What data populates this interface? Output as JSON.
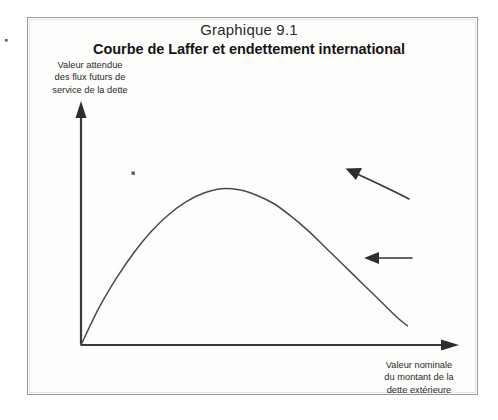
{
  "figure": {
    "label": "Graphique 9.1",
    "title": "Courbe de Laffer et endettement international",
    "y_axis_caption": "Valeur attendue des flux futurs de service de la dette",
    "y_axis_caption_lines": [
      "Valeur attendue",
      "des flux futurs de",
      "service de la dette"
    ],
    "x_axis_caption": "Valeur nominale du montant de la dette extérieure",
    "x_axis_caption_lines": [
      "Valeur nominale",
      "du montant de la",
      "dette extérieure"
    ]
  },
  "colors": {
    "ink": "#2d2d2d",
    "curve": "#4a4a4a",
    "axis": "#3a3a3a",
    "frame": "#9a9a9a",
    "paper": "#fdfdfc"
  },
  "chart_data": {
    "type": "line",
    "title": "Courbe de Laffer et endettement international",
    "subtitle": "Graphique 9.1",
    "xlabel": "Valeur nominale du montant de la dette extérieure",
    "ylabel": "Valeur attendue des flux futurs de service de la dette",
    "grid": false,
    "legend": "none",
    "axis_ticks": false,
    "xlim": [
      0,
      100
    ],
    "ylim": [
      0,
      100
    ],
    "series": [
      {
        "name": "Courbe de Laffer de la dette",
        "x": [
          0,
          5,
          10,
          15,
          20,
          25,
          30,
          35,
          40,
          45,
          50,
          55,
          60,
          65,
          70,
          75,
          80,
          85,
          90,
          93
        ],
        "y": [
          0,
          17,
          31,
          43,
          53,
          61,
          67,
          71,
          73,
          72.5,
          70,
          66,
          60,
          53,
          45,
          37,
          29,
          21,
          13,
          9
        ]
      }
    ],
    "annotations": [
      {
        "name": "upper-arrow",
        "shape": "arrow",
        "direction": "up-left",
        "from_px": [
          408,
          198
        ],
        "to_px": [
          347,
          170
        ],
        "note": "flèche diagonale vers le sommet de la courbe"
      },
      {
        "name": "lower-arrow",
        "shape": "arrow",
        "direction": "left",
        "from_px": [
          412,
          258
        ],
        "to_px": [
          365,
          258
        ],
        "note": "flèche horizontale vers la gauche"
      }
    ],
    "axes_style": {
      "y_axis_arrow": true,
      "x_axis_arrow": true,
      "origin_px": [
        81,
        345
      ],
      "y_axis_top_px": [
        81,
        103
      ],
      "x_axis_right_px": [
        458,
        345
      ]
    }
  }
}
